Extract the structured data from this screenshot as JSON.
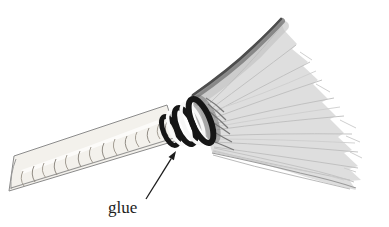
{
  "illustration": {
    "subject": "broom-drawing",
    "annotation": {
      "label": "glue"
    },
    "colors": {
      "background": "#ffffff",
      "head_fill": "#dedede",
      "head_top_edge": "#4d4d4d",
      "bristle_texture": "#bdbdbd",
      "handle_fill": "#f3f1ec",
      "handle_outline": "#8b8b8b",
      "binding_ring_ink": "#151515",
      "annotation_ink": "#1c1c1c"
    }
  }
}
